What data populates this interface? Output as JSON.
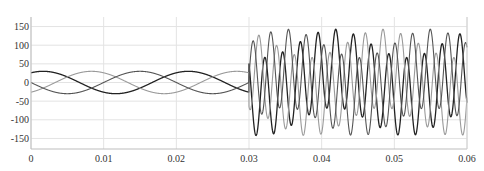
{
  "chart_data": {
    "type": "line",
    "title": "",
    "xlabel": "",
    "ylabel": "",
    "xlim": [
      0,
      0.06
    ],
    "ylim": [
      -177,
      170
    ],
    "grid": true,
    "legend": "none",
    "x_ticks": [
      0,
      0.01,
      0.02,
      0.03,
      0.04,
      0.05,
      0.06
    ],
    "x_tick_labels": [
      "0",
      "0.01",
      "0.02",
      "0.03",
      "0.04",
      "0.05",
      "0.06"
    ],
    "y_ticks": [
      150,
      100,
      50,
      0,
      -50,
      -100,
      -150
    ],
    "y_tick_labels": [
      "150",
      "100",
      "50",
      "0",
      "-50",
      "-100",
      "-150"
    ],
    "switch_time": 0.03,
    "series": [
      {
        "name": "phase A",
        "color": "#222222",
        "width": 1.3,
        "pre": {
          "amp": 30,
          "freq": 50,
          "phase_deg": 60
        },
        "post": {
          "amp_hf": 105,
          "freq_hf": 410,
          "phase_hf_deg": 20,
          "amp_lf": 38,
          "freq_lf": 50,
          "phase_lf_deg": 60
        }
      },
      {
        "name": "phase B",
        "color": "#9a9a9a",
        "width": 1.1,
        "pre": {
          "amp": 30,
          "freq": 50,
          "phase_deg": -60
        },
        "post": {
          "amp_hf": 105,
          "freq_hf": 410,
          "phase_hf_deg": 140,
          "amp_lf": 38,
          "freq_lf": 50,
          "phase_lf_deg": -60
        }
      },
      {
        "name": "phase C",
        "color": "#555555",
        "width": 1.1,
        "pre": {
          "amp": 30,
          "freq": 50,
          "phase_deg": 180
        },
        "post": {
          "amp_hf": 105,
          "freq_hf": 410,
          "phase_hf_deg": 260,
          "amp_lf": 38,
          "freq_lf": 50,
          "phase_lf_deg": 180
        }
      }
    ]
  }
}
